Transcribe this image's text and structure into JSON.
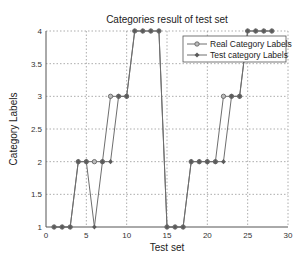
{
  "chart_data": {
    "type": "line",
    "title": "Categories result of test set",
    "xlabel": "Test set",
    "ylabel": "Category Labels",
    "xlim": [
      0,
      30
    ],
    "ylim": [
      1,
      4
    ],
    "xticks": [
      0,
      5,
      10,
      15,
      20,
      25,
      30
    ],
    "yticks": [
      1,
      1.5,
      2,
      2.5,
      3,
      3.5,
      4
    ],
    "ytick_labels": [
      "1",
      "1.5",
      "2",
      "2.5",
      "3",
      "3.5",
      "4"
    ],
    "grid": true,
    "legend_position": "upper right",
    "x": [
      1,
      2,
      3,
      4,
      5,
      6,
      7,
      8,
      9,
      10,
      11,
      12,
      13,
      14,
      15,
      16,
      17,
      18,
      19,
      20,
      21,
      22,
      23,
      24,
      25,
      26,
      27,
      28
    ],
    "series": [
      {
        "name": "Real Category Labels",
        "marker": "circle",
        "values": [
          1,
          1,
          1,
          2,
          2,
          2,
          2,
          3,
          3,
          3,
          4,
          4,
          4,
          4,
          1,
          1,
          1,
          2,
          2,
          2,
          2,
          3,
          3,
          3,
          4,
          4,
          4,
          4
        ]
      },
      {
        "name": "Test category Labels",
        "marker": "diamond",
        "values": [
          1,
          1,
          1,
          2,
          2,
          1,
          2,
          2,
          3,
          3,
          4,
          4,
          4,
          4,
          1,
          1,
          1,
          2,
          2,
          2,
          2,
          2,
          3,
          3,
          4,
          4,
          4,
          4
        ]
      }
    ]
  },
  "colors": {
    "line": "#6e6e6e",
    "marker": "#5a5a5a",
    "grid": "#8a8a8a",
    "axis": "#555555"
  }
}
